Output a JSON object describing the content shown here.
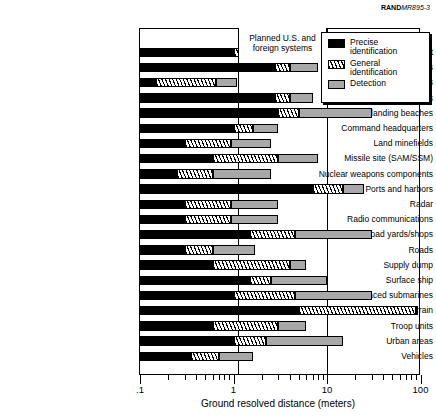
{
  "credit": {
    "brand": "RAND",
    "report": "MR895-3"
  },
  "annotation": {
    "planned_systems": "Planned U.S. and foreign systems"
  },
  "legend": {
    "items": [
      {
        "key": "precise",
        "label": "Precise identification",
        "swatch": "solid-black-swatch"
      },
      {
        "key": "general",
        "label": "General identification",
        "swatch": "diagonal-hatch-swatch"
      },
      {
        "key": "detection",
        "label": "Detection",
        "swatch": "solid-gray-swatch"
      }
    ]
  },
  "chart_data": {
    "type": "bar",
    "orientation": "horizontal",
    "title": "",
    "xlabel": "Ground resolved distance (meters)",
    "ylabel": "",
    "xscale": "log",
    "xlim": [
      0.1,
      100
    ],
    "xticks": [
      0.1,
      1,
      10,
      100
    ],
    "xticklabels": [
      ".1",
      "1",
      "10",
      "100"
    ],
    "grid": "vertical gridlines at 1 and 10",
    "legend_position": "top-right",
    "stacked": true,
    "note": "Each bar is stacked: Precise identification (black) ends first, then General identification (hatched), then Detection (gray). Values are the right-hand edge of each segment in meters.",
    "categories": [
      "Aircraft",
      "Airfield facilities",
      "Artillery/rockets",
      "Bridges",
      "Coast and landing beaches",
      "Command headquarters",
      "Land minefields",
      "Missile site (SAM/SSM)",
      "Nuclear weapons components",
      "Ports and harbors",
      "Radar",
      "Radio communications",
      "Railroad yards/shops",
      "Roads",
      "Supply dump",
      "Surface ship",
      "Surfaced submarines",
      "Terrain",
      "Troop units",
      "Urban areas",
      "Vehicles"
    ],
    "series": [
      {
        "name": "Precise identification",
        "color": "#000000",
        "values": [
          1.0,
          2.8,
          0.15,
          2.8,
          3.0,
          1.0,
          0.3,
          0.6,
          0.25,
          7.0,
          0.3,
          0.3,
          1.5,
          0.3,
          0.6,
          1.5,
          1.0,
          5.0,
          0.6,
          1.0,
          0.35
        ]
      },
      {
        "name": "General identification",
        "color": "#ffffff",
        "hatch": "diagonal",
        "values": [
          1.5,
          4.0,
          0.65,
          4.0,
          5.0,
          1.6,
          0.95,
          3.0,
          0.6,
          15.0,
          0.95,
          0.95,
          4.5,
          0.6,
          4.0,
          2.5,
          4.5,
          90.0,
          3.0,
          2.2,
          0.7
        ]
      },
      {
        "name": "Detection",
        "color": "#a8a8a8",
        "values": [
          5.0,
          8.0,
          1.1,
          7.0,
          30.0,
          3.0,
          2.5,
          8.0,
          2.5,
          25.0,
          3.0,
          3.0,
          30.0,
          1.7,
          6.0,
          10.0,
          30.0,
          90.0,
          6.0,
          15.0,
          1.6
        ]
      }
    ]
  }
}
